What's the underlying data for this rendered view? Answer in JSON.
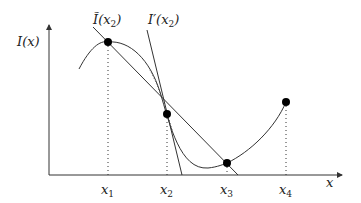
{
  "diagram": {
    "y_axis_label": "I(x)",
    "x_axis_label": "x",
    "secant_label": {
      "main": "Ĩ(x",
      "sub": "2",
      "close": ")"
    },
    "tangent_label": {
      "main": "I′(x",
      "sub": "2",
      "close": ")"
    },
    "ticks": [
      {
        "main": "x",
        "sub": "1"
      },
      {
        "main": "x",
        "sub": "2"
      },
      {
        "main": "x",
        "sub": "3"
      },
      {
        "main": "x",
        "sub": "4"
      }
    ],
    "points": [
      {
        "name": "x1",
        "x": 108,
        "y": 42
      },
      {
        "name": "x2",
        "x": 167,
        "y": 114
      },
      {
        "name": "x3",
        "x": 227,
        "y": 163
      },
      {
        "name": "x4",
        "x": 286,
        "y": 102
      }
    ],
    "colors": {
      "stroke": "#333333",
      "point": "#000000",
      "background": "#ffffff"
    }
  }
}
